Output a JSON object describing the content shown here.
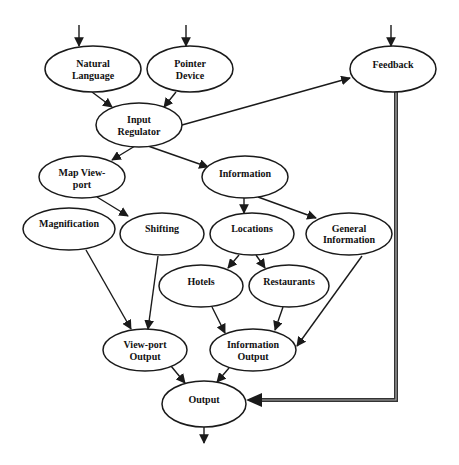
{
  "diagram": {
    "type": "flow diagram",
    "nodes": {
      "natural_language": {
        "line1": "Natural",
        "line2": "Language"
      },
      "pointer_device": {
        "line1": "Pointer",
        "line2": "Device"
      },
      "feedback": {
        "line1": "Feedback"
      },
      "input_regulator": {
        "line1": "Input",
        "line2": "Regulator"
      },
      "map_viewport": {
        "line1": "Map View-",
        "line2": "port"
      },
      "information": {
        "line1": "Information"
      },
      "magnification": {
        "line1": "Magnification"
      },
      "shifting": {
        "line1": "Shifting"
      },
      "locations": {
        "line1": "Locations"
      },
      "general_information": {
        "line1": "General",
        "line2": "Information"
      },
      "hotels": {
        "line1": "Hotels"
      },
      "restaurants": {
        "line1": "Restaurants"
      },
      "viewport_output": {
        "line1": "View-port",
        "line2": "Output"
      },
      "information_output": {
        "line1": "Information",
        "line2": "Output"
      },
      "output": {
        "line1": "Output"
      }
    },
    "edges": [
      [
        "external",
        "Natural Language"
      ],
      [
        "external",
        "Pointer Device"
      ],
      [
        "external",
        "Feedback"
      ],
      [
        "Natural Language",
        "Input Regulator"
      ],
      [
        "Pointer Device",
        "Input Regulator"
      ],
      [
        "Input Regulator",
        "Feedback"
      ],
      [
        "Input Regulator",
        "Map View-port"
      ],
      [
        "Input Regulator",
        "Information"
      ],
      [
        "Map View-port",
        "Shifting"
      ],
      [
        "Information",
        "Locations"
      ],
      [
        "Information",
        "General Information"
      ],
      [
        "Locations",
        "Hotels"
      ],
      [
        "Locations",
        "Restaurants"
      ],
      [
        "Magnification",
        "View-port Output"
      ],
      [
        "Shifting",
        "View-port Output"
      ],
      [
        "Hotels",
        "Information Output"
      ],
      [
        "Restaurants",
        "Information Output"
      ],
      [
        "General Information",
        "Information Output"
      ],
      [
        "View-port Output",
        "Output"
      ],
      [
        "Information Output",
        "Output"
      ],
      [
        "Feedback",
        "Output (double line)"
      ],
      [
        "Output",
        "external"
      ]
    ]
  }
}
